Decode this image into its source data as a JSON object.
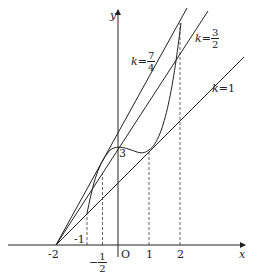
{
  "figure": {
    "axes": {
      "x_label": "x",
      "y_label": "y",
      "origin_label": "O"
    },
    "x_ticks": [
      {
        "label": "-2",
        "value": -2
      },
      {
        "label": "-1",
        "value": -1
      },
      {
        "label_num": "1",
        "label_den": "2",
        "sign": "−",
        "value": -0.5
      },
      {
        "label": "1",
        "value": 1
      },
      {
        "label": "2",
        "value": 2
      }
    ],
    "y_ticks": [
      {
        "label": "3",
        "value": 3
      }
    ],
    "lines": [
      {
        "name": "k=1",
        "label_k": "k",
        "label_eq": "=1",
        "slope": 1
      },
      {
        "name": "k=3/2",
        "label_k": "k",
        "label_eq": "=",
        "num": "3",
        "den": "2",
        "slope": 1.5
      },
      {
        "name": "k=7/4",
        "label_k": "k",
        "label_eq": "=",
        "num": "7",
        "den": "4",
        "slope": 1.75
      }
    ],
    "curve": "f(x) = x^3 - x^2 + 3",
    "common_point": "(-2, 0)",
    "colors": {
      "stroke": "#222222",
      "background": "#ffffff"
    }
  }
}
